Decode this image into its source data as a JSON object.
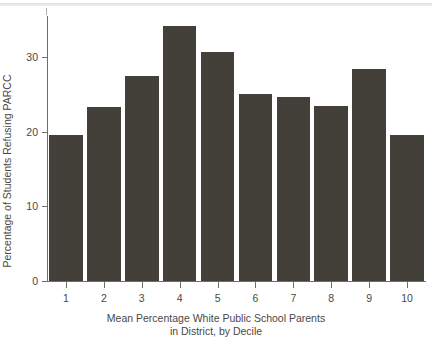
{
  "chart_data": {
    "type": "bar",
    "title": "",
    "xlabel": "Mean Percentage White Public School Parents in District, by Decile",
    "xlabel_line1": "Mean Percentage White Public School Parents",
    "xlabel_line2": "in District, by Decile",
    "ylabel": "Percentage of Students Refusing PARCC",
    "categories": [
      "1",
      "2",
      "3",
      "4",
      "5",
      "6",
      "7",
      "8",
      "9",
      "10"
    ],
    "values": [
      19.5,
      23.3,
      27.5,
      34.1,
      30.7,
      25.0,
      24.7,
      23.5,
      28.4,
      19.5
    ],
    "ylim": [
      0,
      35.5
    ],
    "yticks": [
      0,
      10,
      20,
      30
    ],
    "ytick_labels": [
      "0",
      "10",
      "20",
      "30"
    ],
    "grid": false,
    "legend": false,
    "bar_color": "#433f39",
    "axis_color": "#6f6d6a",
    "text_color": "#4a4845",
    "background": "#ffffff"
  }
}
